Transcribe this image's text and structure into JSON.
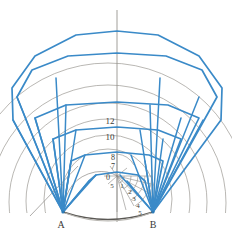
{
  "figure": {
    "name": "nested-polygon-construction",
    "width": 232,
    "height": 239,
    "background": "#ffffff"
  },
  "colors": {
    "polygon_blue": "#3a8ac8",
    "polygon_blue_dark": "#2e7ab5",
    "ray_blue": "#3a8ac8",
    "construction_grey": "#8c8a86",
    "arc_grey": "#9b9892",
    "base_arc_dark": "#5a5854",
    "axis_grey": "#96948f",
    "label_color": "#3a3a38"
  },
  "base_points": {
    "left": {
      "label": "A",
      "x": 63,
      "y": 212,
      "label_x": 61,
      "label_y": 227
    },
    "right": {
      "label": "B",
      "x": 153,
      "y": 212,
      "label_x": 151,
      "label_y": 227
    }
  },
  "axis": {
    "name": "vertical-axis",
    "x": 117,
    "y_top": 10,
    "y_bottom": 222
  },
  "scale_labels": [
    {
      "text": "12",
      "x": 110,
      "y": 122
    },
    {
      "text": "10",
      "x": 110,
      "y": 138
    },
    {
      "text": "8",
      "x": 113,
      "y": 159
    },
    {
      "text": "7",
      "x": 113,
      "y": 167
    },
    {
      "text": "0",
      "x": 108,
      "y": 178
    },
    {
      "text": "5",
      "x": 112,
      "y": 186
    },
    {
      "text": "1",
      "x": 122,
      "y": 186
    },
    {
      "text": "2",
      "x": 129,
      "y": 192
    },
    {
      "text": "3",
      "x": 133,
      "y": 199
    },
    {
      "text": "4",
      "x": 137,
      "y": 206
    },
    {
      "text": "5",
      "x": 139,
      "y": 213
    }
  ],
  "polygons": {
    "count": 6,
    "description": "Nested polygonal arcs spanning from base point A to base point B, each inscribed in a circle of increasing radius.",
    "apex_heights": [
      181,
      161,
      139,
      118,
      88,
      57
    ],
    "half_widths": [
      28,
      46,
      64,
      82,
      100,
      108
    ]
  },
  "circles": {
    "count": 6,
    "description": "Grey construction circles passing through A and B, concentric about points on the vertical axis."
  },
  "polar_grid": {
    "center_x": 117,
    "center_y": 176,
    "ray_count": 9,
    "arc_count": 5,
    "description": "Radial fan of construction rays with concentric arcs forming a polar measuring grid at the origin."
  },
  "fan_rays": {
    "left_origin_x": 63,
    "left_origin_y": 212,
    "right_origin_x": 153,
    "right_origin_y": 212,
    "count_per_side": 11,
    "description": "Blue rays radiating from each base point to the polygon vertices."
  },
  "tangent_line": {
    "name": "tangent-construction-line",
    "x1": 30,
    "y1": 216,
    "x2": 76,
    "y2": 168
  }
}
